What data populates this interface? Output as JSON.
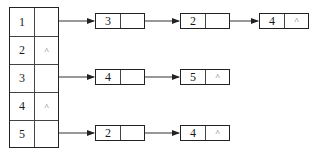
{
  "diagram": {
    "type": "adjacency-list",
    "head_table": [
      {
        "index": "1",
        "pointer": ""
      },
      {
        "index": "2",
        "pointer": "^"
      },
      {
        "index": "3",
        "pointer": ""
      },
      {
        "index": "4",
        "pointer": "^"
      },
      {
        "index": "5",
        "pointer": ""
      }
    ],
    "lists": [
      {
        "row": "1",
        "nodes": [
          {
            "value": "3",
            "next": ""
          },
          {
            "value": "2",
            "next": ""
          },
          {
            "value": "4",
            "next": "^"
          }
        ]
      },
      {
        "row": "3",
        "nodes": [
          {
            "value": "4",
            "next": ""
          },
          {
            "value": "5",
            "next": "^"
          }
        ]
      },
      {
        "row": "5",
        "nodes": [
          {
            "value": "2",
            "next": ""
          },
          {
            "value": "4",
            "next": "^"
          }
        ]
      }
    ]
  }
}
